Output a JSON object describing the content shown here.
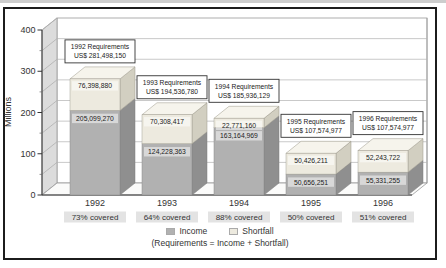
{
  "window": {
    "background": "#ffffff",
    "frame_border_color": "#1c1c1c",
    "top_strip_color": "#cdcdcd"
  },
  "chart_data": {
    "type": "bar",
    "variant": "3d-stacked-column",
    "title": "",
    "xlabel": "",
    "ylabel": "Millions",
    "ylim": [
      0,
      400
    ],
    "y_ticks": [
      0,
      100,
      200,
      300,
      400
    ],
    "y_minor_step": 50,
    "grid": true,
    "legend_position": "bottom",
    "currency_unit": "US$",
    "categories": [
      "1992",
      "1993",
      "1994",
      "1995",
      "1996"
    ],
    "series": [
      {
        "name": "Income",
        "color": "#b1b1b1",
        "side_color": "#8f8f8f",
        "values": [
          205099270,
          124228363,
          163164969,
          50656251,
          55331255
        ],
        "value_labels": [
          "205,099,270",
          "124,228,363",
          "163,164,969",
          "50,656,251",
          "55,331,255"
        ]
      },
      {
        "name": "Shortfall",
        "color": "#edeadf",
        "side_color": "#d2cfc1",
        "top_color": "#f6f4ec",
        "values": [
          76398880,
          70308417,
          22771160,
          50426211,
          52243722
        ],
        "value_labels": [
          "76,398,880",
          "70,308,417",
          "22,771,160",
          "50,426,211",
          "52,243,722"
        ]
      }
    ],
    "requirement_boxes": [
      {
        "line1": "1992 Requirements",
        "line2": "US$ 281,498,150"
      },
      {
        "line1": "1993 Requirements",
        "line2": "US$ 194,536,780"
      },
      {
        "line1": "1994 Requirements",
        "line2": "US$ 185,936,129"
      },
      {
        "line1": "1995 Requirements",
        "line2": "US$ 107,574,977"
      },
      {
        "line1": "1996 Requirements",
        "line2": "US$ 107,574,977"
      }
    ],
    "covered_labels": [
      "73% covered",
      "64% covered",
      "88% covered",
      "50% covered",
      "51% covered"
    ]
  },
  "legend": {
    "items": [
      {
        "label": "Income",
        "color": "#b1b1b1"
      },
      {
        "label": "Shortfall",
        "color": "#edeadf"
      }
    ],
    "note": "(Requirements = Income + Shortfall)"
  }
}
